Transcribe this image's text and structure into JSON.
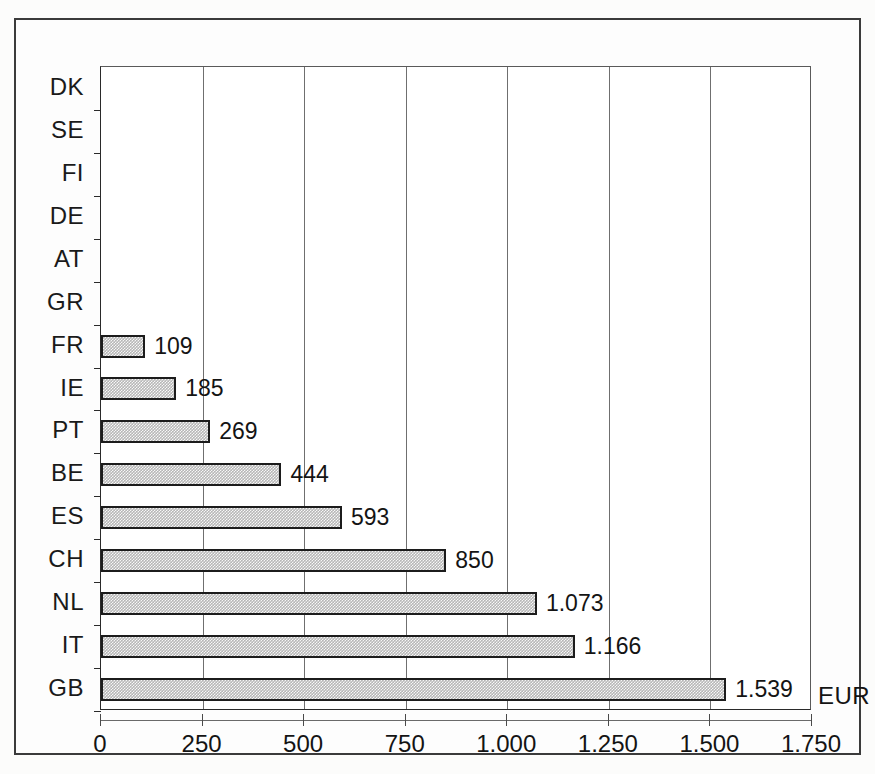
{
  "chart_data": {
    "type": "bar",
    "orientation": "horizontal",
    "title": "",
    "subtitle": "",
    "xlabel": "EUR",
    "ylabel": "",
    "unit_label": "EUR",
    "categories": [
      "DK",
      "SE",
      "FI",
      "DE",
      "AT",
      "GR",
      "FR",
      "IE",
      "PT",
      "BE",
      "ES",
      "CH",
      "NL",
      "IT",
      "GB"
    ],
    "categories_displayed": [
      "DK",
      "SE",
      "FI",
      "DE",
      "AT",
      "GR",
      "FR",
      "IE",
      "PT",
      "BE",
      "ES",
      "CH",
      "NL",
      "IT",
      "GB"
    ],
    "values": [
      0,
      0,
      0,
      0,
      0,
      0,
      109,
      185,
      269,
      444,
      593,
      850,
      1073,
      1166,
      1539
    ],
    "value_labels": [
      "",
      "",
      "",
      "",
      "",
      "",
      "109",
      "185",
      "269",
      "444",
      "593",
      "850",
      "1.073",
      "1.166",
      "1.539"
    ],
    "xlim": [
      0,
      1750
    ],
    "xticks": [
      0,
      250,
      500,
      750,
      1000,
      1250,
      1500,
      1750
    ],
    "xtick_labels": [
      "0",
      "250",
      "500",
      "750",
      "1.000",
      "1.250",
      "1.500",
      "1.750"
    ],
    "grid": "vertical",
    "legend": "none",
    "number_format": "european-dot-thousands",
    "bar_fill_color": "#b7b7b7",
    "bar_border_color": "#1c1c1c",
    "gridline_color": "#6f6f6f",
    "axis_color": "#2a2a2a",
    "background_color": "#ffffff",
    "frame_color": "#3b3b3b"
  },
  "rows": [
    {
      "label": "DK",
      "value": 0,
      "value_label": ""
    },
    {
      "label": "SE",
      "value": 0,
      "value_label": ""
    },
    {
      "label": "FI",
      "value": 0,
      "value_label": ""
    },
    {
      "label": "DE",
      "value": 0,
      "value_label": ""
    },
    {
      "label": "AT",
      "value": 0,
      "value_label": ""
    },
    {
      "label": "GR",
      "value": 0,
      "value_label": ""
    },
    {
      "label": "FR",
      "value": 109,
      "value_label": "109"
    },
    {
      "label": "IE",
      "value": 185,
      "value_label": "185"
    },
    {
      "label": "PT",
      "value": 269,
      "value_label": "269"
    },
    {
      "label": "BE",
      "value": 444,
      "value_label": "444"
    },
    {
      "label": "ES",
      "value": 593,
      "value_label": "593"
    },
    {
      "label": "CH",
      "value": 850,
      "value_label": "850"
    },
    {
      "label": "NL",
      "value": 1073,
      "value_label": "1.073"
    },
    {
      "label": "IT",
      "value": 1166,
      "value_label": "1.166"
    },
    {
      "label": "GB",
      "value": 1539,
      "value_label": "1.539"
    }
  ]
}
